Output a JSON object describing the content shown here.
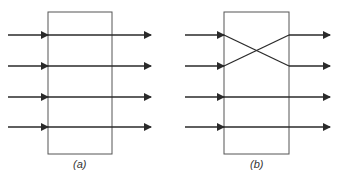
{
  "panels": [
    {
      "id": "a",
      "caption": "(a)",
      "box": {
        "x": 48,
        "y": 12,
        "w": 64,
        "h": 142
      },
      "lines": [
        {
          "in_y": 35,
          "out_y": 35
        },
        {
          "in_y": 66,
          "out_y": 66
        },
        {
          "in_y": 97,
          "out_y": 97
        },
        {
          "in_y": 127,
          "out_y": 127
        }
      ],
      "input_start_x": 8,
      "output_end_x": 151,
      "description": "Straight-through: 4 inputs each map directly to same output"
    },
    {
      "id": "b",
      "caption": "(b)",
      "box": {
        "x": 224,
        "y": 12,
        "w": 65,
        "h": 142
      },
      "lines": [
        {
          "in_y": 35,
          "out_y": 66
        },
        {
          "in_y": 66,
          "out_y": 35
        },
        {
          "in_y": 97,
          "out_y": 97
        },
        {
          "in_y": 127,
          "out_y": 127
        }
      ],
      "input_start_x": 185,
      "output_end_x": 330,
      "description": "Top two lines crossed (swapped), bottom two straight-through"
    }
  ],
  "colors": {
    "stroke": "#2a2a2a",
    "box": "#555555",
    "background": "#ffffff"
  }
}
